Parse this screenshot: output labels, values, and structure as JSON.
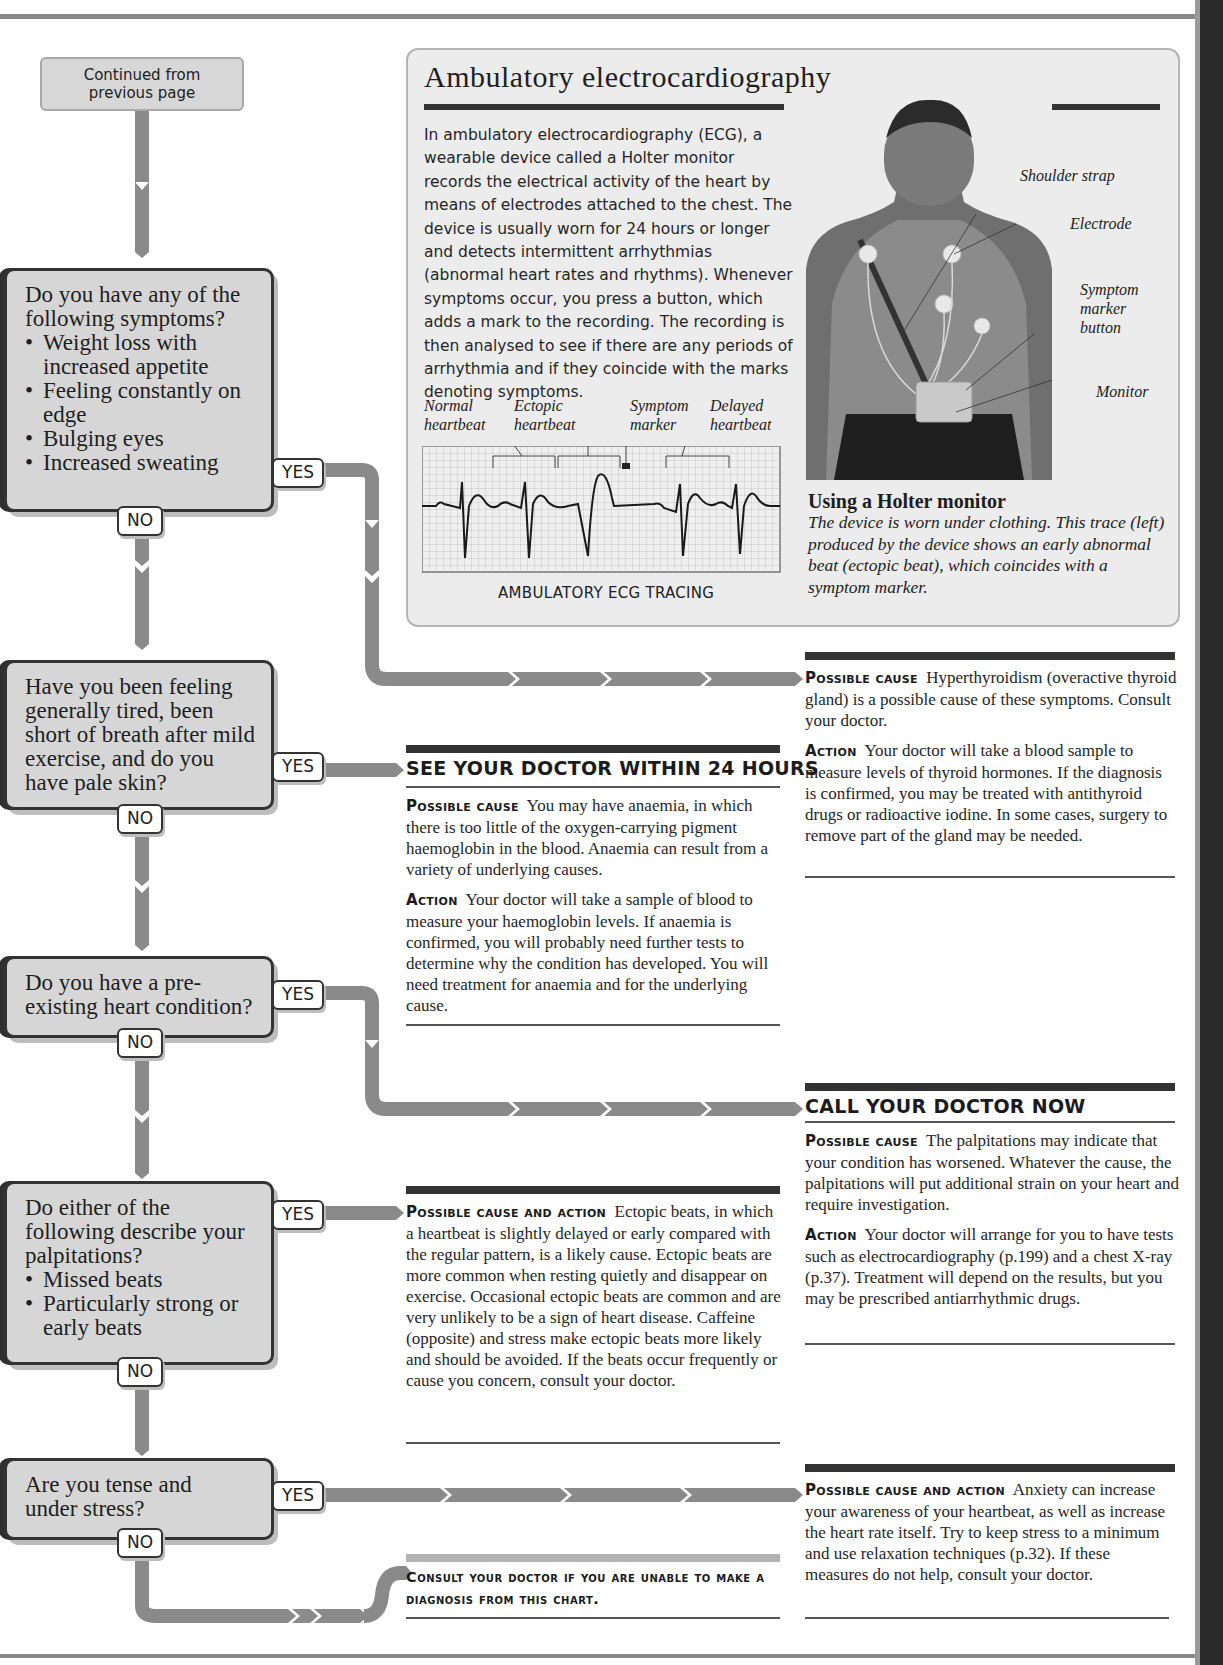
{
  "flowchart": {
    "continued_label": "Continued from previous page",
    "yes_label": "YES",
    "no_label": "NO",
    "questions": [
      {
        "text": "Do you have any of the following symptoms?",
        "bullets": [
          "Weight loss with increased appetite",
          "Feeling constantly on edge",
          "Bulging eyes",
          "Increased sweating"
        ]
      },
      {
        "text": "Have you been feeling generally tired, been short of breath after mild exercise, and do you have pale skin?",
        "bullets": []
      },
      {
        "text": "Do you have a pre-existing heart condition?",
        "bullets": []
      },
      {
        "text": "Do either of the following describe your palpitations?",
        "bullets": [
          "Missed beats",
          "Particularly strong or early beats"
        ]
      },
      {
        "text": "Are you tense and under stress?",
        "bullets": []
      }
    ]
  },
  "ecg_panel": {
    "title": "Ambulatory electrocardiography",
    "body": "In ambulatory electrocardiography (ECG), a wearable device called a Holter monitor records the electrical activity of the heart by means of electrodes attached to the chest. The device is usually worn for 24 hours or longer and detects intermittent arrhythmias (abnormal heart rates and rhythms). Whenever symptoms occur, you press a button, which adds a mark to the recording. The recording is then analysed to see if there are any periods of arrhythmia and if they coincide with the marks denoting symptoms.",
    "trace_labels": [
      "Normal heartbeat",
      "Ectopic heartbeat",
      "Symptom marker",
      "Delayed heartbeat"
    ],
    "trace_caption": "AMBULATORY ECG TRACING",
    "photo_labels": [
      "Shoulder strap",
      "Electrode",
      "Symptom marker button",
      "Monitor"
    ],
    "photo_title": "Using a Holter monitor",
    "photo_caption": "The device is worn under clothing. This trace (left) produced by the device shows an early abnormal beat (ectopic beat), which coincides with a symptom marker."
  },
  "results": {
    "hyperthyroid": {
      "cause_label": "Possible cause",
      "cause_text": "Hyperthyroidism (overactive thyroid gland) is a possible cause of these symptoms. Consult your doctor.",
      "action_label": "Action",
      "action_text": "Your doctor will take a blood sample to measure levels of thyroid hormones. If the diagnosis is confirmed, you may be treated with antithyroid drugs or radioactive iodine. In some cases, surgery to remove part of the gland may be needed."
    },
    "anaemia": {
      "urgency": "SEE YOUR DOCTOR WITHIN 24 HOURS",
      "cause_label": "Possible cause",
      "cause_text": "You may have anaemia, in which there is too little of the oxygen-carrying pigment haemoglobin in the blood. Anaemia can result from a variety of underlying causes.",
      "action_label": "Action",
      "action_text": "Your doctor will take a sample of blood to measure your haemoglobin levels. If anaemia is confirmed, you will probably need further tests to determine why the condition has developed. You will need treatment for anaemia and for the underlying cause."
    },
    "heart_condition": {
      "urgency": "CALL YOUR DOCTOR NOW",
      "cause_label": "Possible cause",
      "cause_text": "The palpitations may indicate that your condition has worsened. Whatever the cause, the palpitations will put additional strain on your heart and require investigation.",
      "action_label": "Action",
      "action_text": "Your doctor will arrange for you to have tests such as electrocardiography (p.199) and a chest X-ray (p.37). Treatment will depend on the results, but you may be prescribed antiarrhythmic drugs."
    },
    "ectopic": {
      "label": "Possible cause and action",
      "text": "Ectopic beats, in which a heartbeat is slightly delayed or early compared with the regular pattern, is a likely cause. Ectopic beats are more common when resting quietly and disappear on exercise. Occasional ectopic beats are common and are very unlikely to be a sign of heart disease. Caffeine (opposite) and stress make ectopic beats more likely and should be avoided. If the beats occur frequently or cause you concern, consult your doctor."
    },
    "anxiety": {
      "label": "Possible cause and action",
      "text": "Anxiety can increase your awareness of your heartbeat, as well as increase the heart rate itself. Try to keep stress to a minimum and use relaxation techniques (p.32). If these measures do not help, consult your doctor."
    },
    "consult": {
      "text": "Consult your doctor if you are unable to make a diagnosis from this chart."
    }
  }
}
